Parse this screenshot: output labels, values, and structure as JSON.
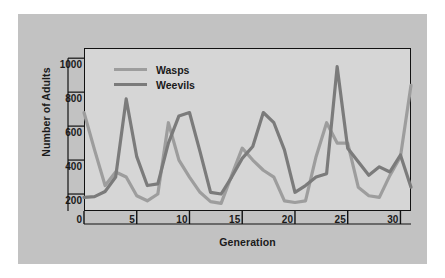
{
  "chart_data": {
    "type": "line",
    "title": "",
    "xlabel": "Generation",
    "ylabel": "Number of Adults",
    "xlim": [
      0,
      31
    ],
    "ylim": [
      100,
      1060
    ],
    "xticks": [
      "0",
      "5",
      "10",
      "15",
      "20",
      "25",
      "30"
    ],
    "xtick_values": [
      0,
      5,
      10,
      15,
      20,
      25,
      30
    ],
    "yticks": [
      "200",
      "400",
      "600",
      "800",
      "1000"
    ],
    "ytick_values": [
      200,
      400,
      600,
      800,
      1000
    ],
    "grid": false,
    "legend_position": "upper-left-inside",
    "series": [
      {
        "name": "Wasps",
        "color": "#9d9d9d",
        "x": [
          0,
          1,
          2,
          3,
          4,
          5,
          6,
          7,
          8,
          9,
          10,
          11,
          12,
          13,
          14,
          15,
          16,
          17,
          18,
          19,
          20,
          21,
          22,
          23,
          24,
          25,
          26,
          27,
          28,
          29,
          30,
          31
        ],
        "values": [
          680,
          460,
          250,
          330,
          300,
          190,
          160,
          200,
          620,
          400,
          300,
          210,
          155,
          145,
          310,
          470,
          400,
          340,
          300,
          160,
          150,
          160,
          420,
          620,
          500,
          500,
          240,
          190,
          180,
          310,
          420,
          840
        ]
      },
      {
        "name": "Weevils",
        "color": "#7b7b7b",
        "x": [
          0,
          1,
          2,
          3,
          4,
          5,
          6,
          7,
          8,
          9,
          10,
          11,
          12,
          13,
          14,
          15,
          16,
          17,
          18,
          19,
          20,
          21,
          22,
          23,
          24,
          25,
          26,
          27,
          28,
          29,
          30,
          31
        ],
        "values": [
          180,
          185,
          215,
          300,
          760,
          420,
          250,
          260,
          500,
          660,
          680,
          450,
          210,
          200,
          300,
          410,
          480,
          680,
          620,
          460,
          210,
          250,
          300,
          320,
          950,
          470,
          390,
          310,
          360,
          330,
          430,
          240
        ]
      }
    ],
    "legend": [
      {
        "label": "Wasps",
        "color": "#9d9d9d"
      },
      {
        "label": "Weevils",
        "color": "#7b7b7b"
      }
    ]
  },
  "figure": {
    "background": "#c2c2c2",
    "plot_background": "#d6d6d6",
    "axis_color": "#111111"
  }
}
